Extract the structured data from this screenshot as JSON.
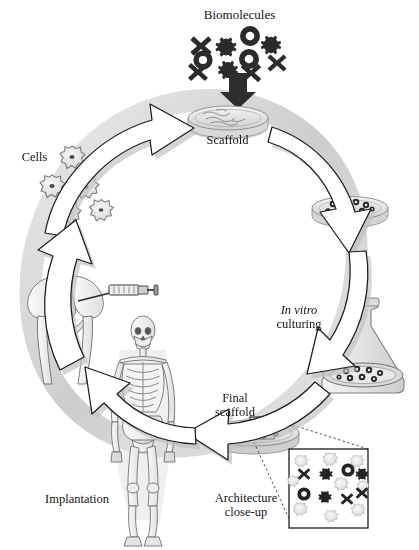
{
  "figure": {
    "background_color": "#ffffff",
    "ink_color": "#141414"
  },
  "labels": {
    "biomolecules": "Biomolecules",
    "scaffold": "Scaffold",
    "in_vitro_italic": "In vitro",
    "in_vitro_roman": "culturing",
    "cells": "Cells",
    "implantation": "Implantation",
    "final_scaffold_line1": "Final",
    "final_scaffold_line2": "scaffold",
    "architecture_line1": "Architecture",
    "architecture_line2": "close-up"
  },
  "icons": {
    "biomolecule_shapes": [
      "x-icon",
      "gear-icon",
      "ring-icon"
    ],
    "cell_shape": "cell-blob-icon",
    "dish": "petri-dish-icon",
    "flask": "erlenmeyer-flask-icon",
    "syringe": "syringe-icon",
    "pelvis": "pelvis-bone-icon",
    "skeleton": "human-skeleton-icon",
    "arrow": "curved-arrow-icon",
    "down-arrow": "down-arrow-icon"
  },
  "colors": {
    "arrow_fill": "#ffffff",
    "arrow_stroke": "#1c1c1c",
    "ring_band": "#d4d4d4",
    "shadow": "#c8c8c8",
    "dark_molecule": "#2a2a2a",
    "light_molecule": "#cfcfcf",
    "dish_glass": "#e6e6e6",
    "bone": "#f2f2f2"
  },
  "diagram_nodes": [
    {
      "id": "biomolecules",
      "label": "Biomolecules",
      "position": "top"
    },
    {
      "id": "scaffold",
      "label": "Scaffold",
      "position": "top-center"
    },
    {
      "id": "seeded-scaffold",
      "label": "",
      "position": "right-upper"
    },
    {
      "id": "in-vitro",
      "label": "In vitro culturing",
      "position": "right-lower"
    },
    {
      "id": "final-scaffold",
      "label": "Final scaffold",
      "position": "bottom-center"
    },
    {
      "id": "architecture",
      "label": "Architecture close-up",
      "position": "bottom-right"
    },
    {
      "id": "implantation",
      "label": "Implantation",
      "position": "bottom-left"
    },
    {
      "id": "cells",
      "label": "Cells",
      "position": "left-upper"
    }
  ]
}
